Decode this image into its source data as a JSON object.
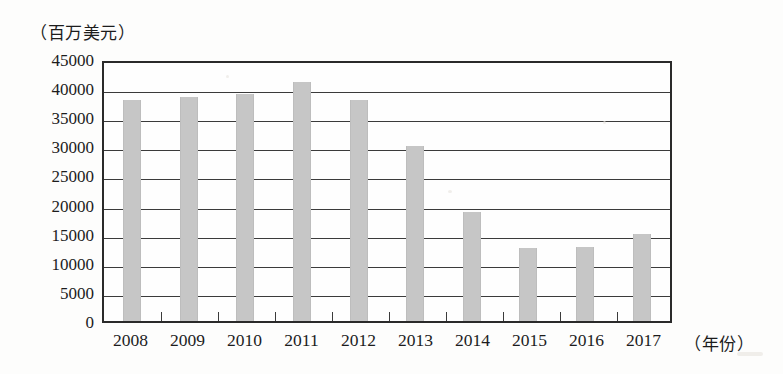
{
  "chart_data": {
    "type": "bar",
    "title": "",
    "subtitle": "",
    "ylabel": "（百万美元）",
    "xlabel": "（年份）",
    "categories": [
      "2008",
      "2009",
      "2010",
      "2011",
      "2012",
      "2013",
      "2014",
      "2015",
      "2016",
      "2017"
    ],
    "values": [
      38000,
      38500,
      39000,
      41000,
      37900,
      30100,
      18700,
      12600,
      12700,
      15000
    ],
    "ylim": [
      0,
      45000
    ],
    "yticks": [
      45000,
      40000,
      35000,
      30000,
      25000,
      20000,
      15000,
      10000,
      5000,
      0
    ],
    "ytick_labels": [
      "45000",
      "40000",
      "35000",
      "30000",
      "25000",
      "20000",
      "15000",
      "10000",
      "5000",
      "0"
    ],
    "grid": true,
    "legend": "none",
    "series": [
      {
        "name": "",
        "values": [
          38000,
          38500,
          39000,
          41000,
          37900,
          30100,
          18700,
          12600,
          12700,
          15000
        ]
      }
    ],
    "colors": {
      "bar_fill": "#c6c6c6",
      "axis": "#2a2a2a",
      "grid": "#3b3b3b",
      "background": "#fdfdfc",
      "text": "#1c1c1c"
    }
  }
}
